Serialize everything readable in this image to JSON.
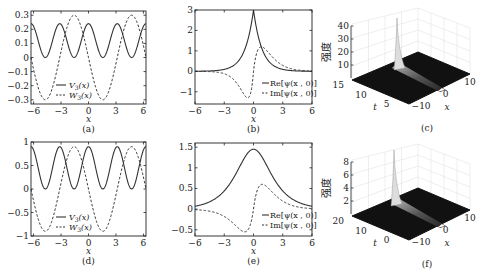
{
  "chart_data": [
    {
      "id": "a",
      "type": "line",
      "caption": "(a)",
      "xlabel": "x",
      "ylabel": "",
      "xlim": [
        -6.28,
        6.28
      ],
      "ylim": [
        -0.33,
        0.33
      ],
      "xticks": [
        -6,
        -3,
        0,
        3,
        6
      ],
      "yticks": [
        -0.3,
        -0.2,
        -0.1,
        0,
        0.1,
        0.2,
        0.3
      ],
      "ytick_labels": [
        "−0.3",
        "−0.2",
        "−0.1",
        "0",
        "0.1",
        "0.2",
        "0.3"
      ],
      "legend_position": "lower left",
      "series": [
        {
          "name": "V3(x)",
          "style": "solid",
          "formula": "0.12+0.12*cos(2x)",
          "min": 0,
          "max": 0.24
        },
        {
          "name": "W3(x)",
          "style": "dashed",
          "formula": "-0.3*sin(x)",
          "min": -0.3,
          "max": 0.3
        }
      ],
      "box": [
        31,
        11,
        146,
        104
      ]
    },
    {
      "id": "b",
      "type": "line",
      "caption": "(b)",
      "xlabel": "x",
      "ylabel": "",
      "xlim": [
        -6,
        6
      ],
      "ylim": [
        -1.6,
        3
      ],
      "xticks": [
        -6,
        -3,
        0,
        3,
        6
      ],
      "yticks": [
        -1,
        0,
        1,
        2,
        3
      ],
      "ytick_labels": [
        "−1",
        "0",
        "1",
        "2",
        "3"
      ],
      "legend_position": "lower right",
      "series": [
        {
          "name": "Re[ψ(x, 0)]",
          "style": "solid",
          "peak": {
            "x": 0,
            "y": 3
          }
        },
        {
          "name": "Im[ψ(x, 0)]",
          "style": "dashed",
          "min": {
            "x": -0.6,
            "y": -1.3
          },
          "max": {
            "x": 0.8,
            "y": 1.2
          }
        }
      ],
      "box": [
        195,
        10,
        312,
        104
      ]
    },
    {
      "id": "c",
      "type": "surface3d",
      "caption": "(c)",
      "zlabel": "强度",
      "xlabel": "x",
      "tlabel": "t",
      "zticks": [
        10,
        20,
        30,
        40
      ],
      "tticks": [
        5,
        10,
        15
      ],
      "xticks": [
        -10,
        0,
        10
      ],
      "zmax": 40,
      "peak_value": 40
    },
    {
      "id": "d",
      "type": "line",
      "caption": "(d)",
      "xlabel": "x",
      "ylabel": "",
      "xlim": [
        -6.28,
        6.28
      ],
      "ylim": [
        -1,
        1
      ],
      "xticks": [
        -6,
        -3,
        0,
        3,
        6
      ],
      "yticks": [
        -1,
        -0.5,
        0,
        0.5,
        1
      ],
      "ytick_labels": [
        "−1",
        "−0.5",
        "0",
        "0.5",
        "1"
      ],
      "legend_position": "lower left",
      "series": [
        {
          "name": "V3(x)",
          "style": "solid",
          "formula": "0.45+0.45*cos(2x)",
          "min": 0,
          "max": 0.9
        },
        {
          "name": "W3(x)",
          "style": "dashed",
          "formula": "-0.9*sin(x)",
          "min": -0.9,
          "max": 0.9
        }
      ],
      "box": [
        31,
        142,
        146,
        236
      ]
    },
    {
      "id": "e",
      "type": "line",
      "caption": "(e)",
      "xlabel": "x",
      "ylabel": "",
      "xlim": [
        -6,
        6
      ],
      "ylim": [
        -0.65,
        1.6
      ],
      "xticks": [
        -6,
        -3,
        0,
        3,
        6
      ],
      "yticks": [
        -0.5,
        0,
        0.5,
        1,
        1.5
      ],
      "ytick_labels": [
        "−0.5",
        "0",
        "0.5",
        "1",
        "1.5"
      ],
      "legend_position": "lower right",
      "series": [
        {
          "name": "Re[ψ(x, 0)]",
          "style": "solid",
          "peak": {
            "x": 0,
            "y": 1.45
          }
        },
        {
          "name": "Im[ψ(x, 0)]",
          "style": "dashed",
          "min": {
            "x": -0.9,
            "y": -0.55
          },
          "max": {
            "x": 0.9,
            "y": 0.6
          }
        }
      ],
      "box": [
        195,
        143,
        312,
        236
      ]
    },
    {
      "id": "f",
      "type": "surface3d",
      "caption": "(f)",
      "zlabel": "强度",
      "xlabel": "x",
      "tlabel": "t",
      "zticks": [
        2,
        4,
        6,
        8
      ],
      "tticks": [
        0,
        10,
        20
      ],
      "xticks": [
        -10,
        0,
        10
      ],
      "zmax": 8,
      "peak_value": 8
    }
  ],
  "legend": {
    "V": "V",
    "V_sub": "3",
    "W": "W",
    "W_sub": "3",
    "arg": "(x)",
    "re": "Re[ψ(x , 0)]",
    "im": "Im[ψ(x , 0)]"
  }
}
